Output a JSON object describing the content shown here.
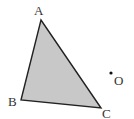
{
  "diagram": {
    "type": "geometry",
    "triangle": {
      "vertices": [
        {
          "label": "A",
          "x": 41,
          "y": 20
        },
        {
          "label": "B",
          "x": 21,
          "y": 100
        },
        {
          "label": "C",
          "x": 101,
          "y": 108
        }
      ],
      "fill": "#c8c8c8",
      "stroke": "#222222"
    },
    "point": {
      "label": "O",
      "x": 111,
      "y": 73
    },
    "labels": {
      "a": "A",
      "b": "B",
      "c": "C",
      "o": "O"
    }
  }
}
